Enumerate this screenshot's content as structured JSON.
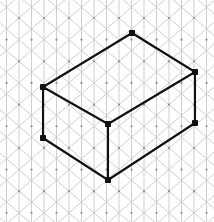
{
  "figure": {
    "canvas": {
      "width": 214,
      "height": 222,
      "background": "#ffffff"
    },
    "grid": {
      "type": "isometric-triangular",
      "line_color": "#c9c9c9",
      "line_width": 0.9,
      "dot_color": "#8e8e8e",
      "dot_radius": 1.1,
      "spacing_px": 25,
      "half_spacing_px": 12.5,
      "row_height_px": 21.65,
      "origin_x": 19,
      "origin_y": 18,
      "vertical_line_count": 17,
      "diagonal_angle_deg": 30,
      "dot_rows": 10,
      "dot_cols": 9
    },
    "shape": {
      "name": "cuboid",
      "stroke_color": "#111111",
      "stroke_width": 2.1,
      "vertex_marker": "filled-square",
      "vertex_marker_size": 6,
      "vertices": [
        {
          "id": "top-back",
          "label": "A",
          "x": 132,
          "y": 33
        },
        {
          "id": "left-top",
          "label": "B",
          "x": 43,
          "y": 87
        },
        {
          "id": "right-top",
          "label": "C",
          "x": 195,
          "y": 72
        },
        {
          "id": "front-top",
          "label": "D",
          "x": 108,
          "y": 124
        },
        {
          "id": "left-bottom",
          "label": "E",
          "x": 43,
          "y": 138
        },
        {
          "id": "right-bottom",
          "label": "F",
          "x": 195,
          "y": 123
        },
        {
          "id": "front-bottom",
          "label": "G",
          "x": 108,
          "y": 180
        }
      ],
      "edges": [
        {
          "id": "top-face-back-left",
          "from": "top-back",
          "to": "left-top",
          "style": "visible"
        },
        {
          "id": "top-face-back-right",
          "from": "top-back",
          "to": "right-top",
          "style": "visible"
        },
        {
          "id": "top-face-front-left",
          "from": "left-top",
          "to": "front-top",
          "style": "visible"
        },
        {
          "id": "top-face-front-right",
          "from": "front-top",
          "to": "right-top",
          "style": "visible"
        },
        {
          "id": "vertical-left",
          "from": "left-top",
          "to": "left-bottom",
          "style": "visible"
        },
        {
          "id": "vertical-front",
          "from": "front-top",
          "to": "front-bottom",
          "style": "visible"
        },
        {
          "id": "vertical-right",
          "from": "right-top",
          "to": "right-bottom",
          "style": "visible"
        },
        {
          "id": "bottom-front-left",
          "from": "left-bottom",
          "to": "front-bottom",
          "style": "visible"
        },
        {
          "id": "bottom-front-right",
          "from": "front-bottom",
          "to": "right-bottom",
          "style": "visible"
        }
      ],
      "faces": [
        {
          "id": "face-top",
          "vertices": [
            "top-back",
            "left-top",
            "front-top",
            "right-top"
          ]
        },
        {
          "id": "face-left",
          "vertices": [
            "left-top",
            "left-bottom",
            "front-bottom",
            "front-top"
          ]
        },
        {
          "id": "face-right",
          "vertices": [
            "front-top",
            "front-bottom",
            "right-bottom",
            "right-top"
          ]
        }
      ]
    }
  }
}
